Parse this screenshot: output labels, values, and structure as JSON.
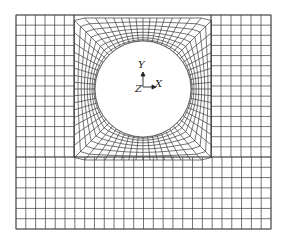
{
  "figure": {
    "type": "finite-element mesh",
    "outer_bounds": {
      "x0": 16,
      "y0": 15,
      "x1": 271,
      "y1": 229
    },
    "refined_block": {
      "x0": 74,
      "y0": 15,
      "x1": 211,
      "y1": 157
    },
    "hole": {
      "cx": 143,
      "cy": 89,
      "r": 48
    },
    "line_color": "#3a3a3a",
    "background": "#ffffff"
  },
  "axes": {
    "y_label": "Y",
    "z_label": "Z",
    "x_label": "X",
    "origin": {
      "x": 143,
      "y": 89
    }
  }
}
